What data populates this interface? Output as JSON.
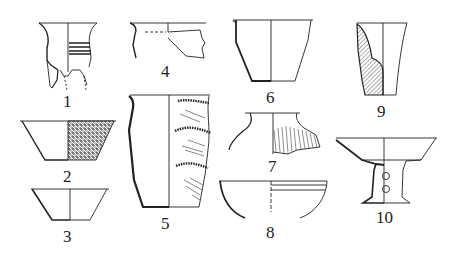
{
  "figure": {
    "type": "archaeological pottery drawing plate",
    "ink_color": "#222222",
    "background": "#ffffff",
    "items": [
      {
        "id": "1",
        "label": "1",
        "description": "flared-rim vessel with corded band and broken tripod legs"
      },
      {
        "id": "2",
        "label": "2",
        "description": "shallow basin with textured exterior"
      },
      {
        "id": "3",
        "label": "3",
        "description": "small plain bowl"
      },
      {
        "id": "4",
        "label": "4",
        "description": "rim fragment with incised lines"
      },
      {
        "id": "5",
        "label": "5",
        "description": "tall jar with appliqué rope bands and cord marks"
      },
      {
        "id": "6",
        "label": "6",
        "description": "straight-sided cup with flat base"
      },
      {
        "id": "7",
        "label": "7",
        "description": "jar with short neck and cord-marked shoulder"
      },
      {
        "id": "8",
        "label": "8",
        "description": "hemispherical bowl with incised lines"
      },
      {
        "id": "9",
        "label": "9",
        "description": "thick-walled beaker in section (hatched)"
      },
      {
        "id": "10",
        "label": "10",
        "description": "pedestal dish (dou) with perforated stem"
      }
    ]
  }
}
